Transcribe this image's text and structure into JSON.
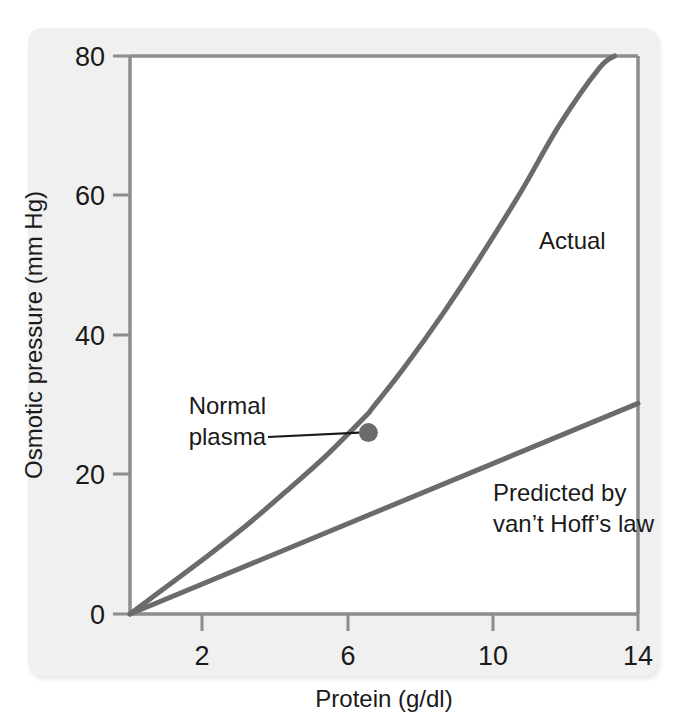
{
  "chart_data": {
    "type": "line",
    "title": "",
    "subtitle": "",
    "xlabel": "Protein (g/dl)",
    "ylabel": "Osmotic pressure (mm Hg)",
    "xlim": [
      1,
      14
    ],
    "ylim": [
      0,
      80
    ],
    "xticks": [
      2,
      6,
      10,
      14
    ],
    "xtick_labels": [
      "2",
      "6",
      "10",
      "14"
    ],
    "yticks": [
      0,
      20,
      40,
      60,
      80
    ],
    "ytick_labels": [
      "0",
      "20",
      "40",
      "60",
      "80"
    ],
    "grid": false,
    "legend": "none",
    "series": [
      {
        "name": "Actual",
        "label": "Actual",
        "style": "curve",
        "color": "#6b6b6b",
        "x": [
          1,
          2,
          3,
          4,
          5,
          6,
          7,
          7.2,
          8,
          9,
          10,
          11,
          12,
          13,
          13.4
        ],
        "y": [
          0,
          4.2,
          8.4,
          12.8,
          17.6,
          22.6,
          28.2,
          29.5,
          35.2,
          43.0,
          51.5,
          60.5,
          70.2,
          78.2,
          80.0
        ]
      },
      {
        "name": "Predicted by van't Hoff's law",
        "label": "Predicted by\nvan't Hoff's law",
        "style": "line",
        "color": "#6b6b6b",
        "x": [
          1,
          14
        ],
        "y": [
          0,
          30.2
        ]
      }
    ],
    "annotations": [
      {
        "name": "normal-plasma",
        "text_line1": "Normal",
        "text_line2": "plasma",
        "point_x": 7.1,
        "point_y": 26.0,
        "marker": "dot"
      },
      {
        "name": "actual-series-label",
        "text_line1": "Actual",
        "text_line2": ""
      },
      {
        "name": "vant-hoff-series-label",
        "text_line1": "Predicted by",
        "text_line2": "van’t Hoff’s law"
      }
    ],
    "colors": {
      "curve": "#6b6b6b",
      "frame": "#8d8d8d",
      "text": "#1a1a1a",
      "panel_background": "#f0f0f0",
      "plot_background": "#ffffff"
    }
  },
  "axes": {
    "y_tick_0": "0",
    "y_tick_20": "20",
    "y_tick_40": "40",
    "y_tick_60": "60",
    "y_tick_80": "80",
    "x_tick_2": "2",
    "x_tick_6": "6",
    "x_tick_10": "10",
    "x_tick_14": "14",
    "x_axis_title": "Protein (g/dl)",
    "y_axis_title": "Osmotic pressure (mm Hg)"
  },
  "labels": {
    "actual": "Actual",
    "normal_plasma_line1": "Normal",
    "normal_plasma_line2": "plasma",
    "vant_hoff_line1": "Predicted by",
    "vant_hoff_line2": "van’t Hoff’s law"
  }
}
